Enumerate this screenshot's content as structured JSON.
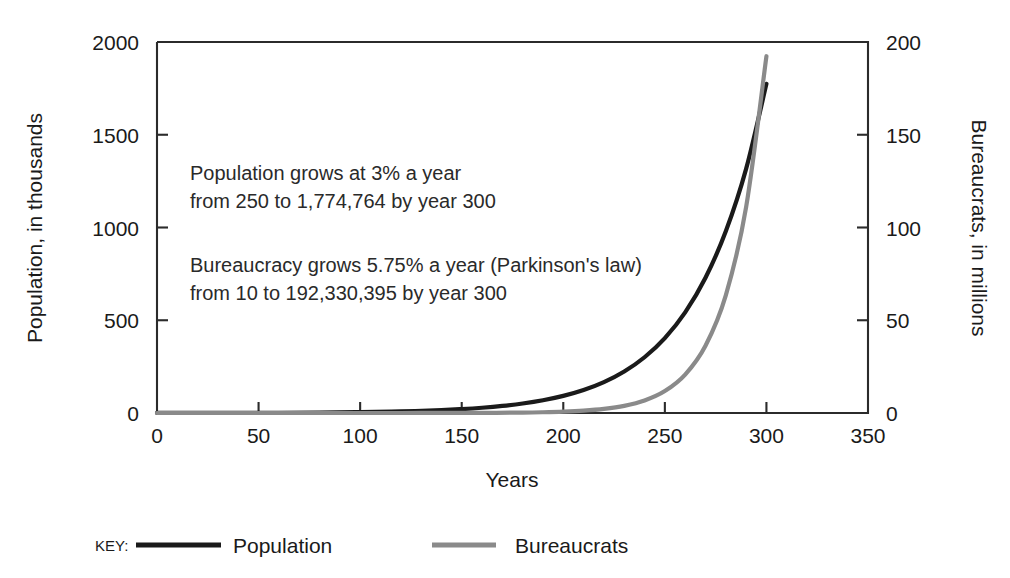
{
  "chart_data": {
    "type": "line",
    "title": "",
    "xlabel": "Years",
    "ylabel": "Population, in thousands",
    "y2label": "Bureaucrats, in millions",
    "xlim": [
      0,
      350
    ],
    "ylim": [
      0,
      2000
    ],
    "y2lim": [
      0,
      200
    ],
    "grid": false,
    "legend_position": "bottom",
    "x_ticks": [
      "0",
      "50",
      "100",
      "150",
      "200",
      "250",
      "300",
      "350"
    ],
    "x_tick_values": [
      0,
      50,
      100,
      150,
      200,
      250,
      300,
      350
    ],
    "y_ticks": [
      "0",
      "500",
      "1000",
      "1500",
      "2000"
    ],
    "y_tick_values": [
      0,
      500,
      1000,
      1500,
      2000
    ],
    "y2_ticks": [
      "0",
      "50",
      "100",
      "150",
      "200"
    ],
    "y2_tick_values": [
      0,
      50,
      100,
      150,
      200
    ],
    "series": [
      {
        "name": "Population",
        "axis": "left",
        "color": "#1a1a1a",
        "stroke_width": 4.2,
        "start_value": 250,
        "growth_rate_percent": 3,
        "end_year": 300,
        "end_value": 1774764,
        "units": "thousands",
        "x": [
          0,
          20,
          40,
          60,
          80,
          100,
          120,
          140,
          150,
          160,
          170,
          180,
          190,
          200,
          210,
          220,
          230,
          240,
          250,
          260,
          270,
          280,
          290,
          300
        ],
        "values": [
          0.25,
          0.451,
          0.815,
          1.472,
          2.658,
          4.802,
          8.673,
          15.664,
          21.046,
          28.28,
          38.0,
          51.06,
          68.61,
          92.19,
          123.87,
          166.45,
          223.66,
          300.53,
          403.8,
          542.56,
          729.04,
          979.62,
          1316.36,
          1774.76
        ]
      },
      {
        "name": "Bureaucrats",
        "axis": "right",
        "color": "#8a8a8a",
        "stroke_width": 4.2,
        "start_value": 10,
        "growth_rate_percent": 5.75,
        "law": "Parkinson's law",
        "end_year": 300,
        "end_value": 192330395,
        "units": "millions",
        "x": [
          0,
          20,
          40,
          60,
          80,
          100,
          120,
          140,
          160,
          180,
          190,
          200,
          210,
          220,
          230,
          240,
          250,
          260,
          270,
          280,
          290,
          300
        ],
        "values": [
          1e-05,
          3.06e-05,
          9.37e-05,
          0.000287,
          0.000878,
          0.002688,
          0.008229,
          0.02519,
          0.07712,
          0.23609,
          0.41304,
          0.72265,
          1.26437,
          2.21219,
          3.87049,
          6.77171,
          11.84766,
          20.72767,
          36.26469,
          63.45017,
          111.0146,
          192.33039
        ]
      }
    ],
    "annotations": [
      {
        "id": "population-annotation",
        "lines": [
          "Population grows at 3% a year",
          "from 250 to 1,774,764 by year 300"
        ]
      },
      {
        "id": "bureaucracy-annotation",
        "lines": [
          "Bureaucracy grows 5.75% a year (Parkinson's law)",
          "from 10 to 192,330,395 by year 300"
        ]
      }
    ],
    "legend": {
      "key_label": "KEY:",
      "entries": [
        {
          "label": "Population",
          "color": "#1a1a1a"
        },
        {
          "label": "Bureaucrats",
          "color": "#8a8a8a"
        }
      ]
    },
    "colors": {
      "population": "#1a1a1a",
      "bureaucrats": "#8a8a8a",
      "axis": "#2b2b2b",
      "background": "#ffffff"
    }
  }
}
